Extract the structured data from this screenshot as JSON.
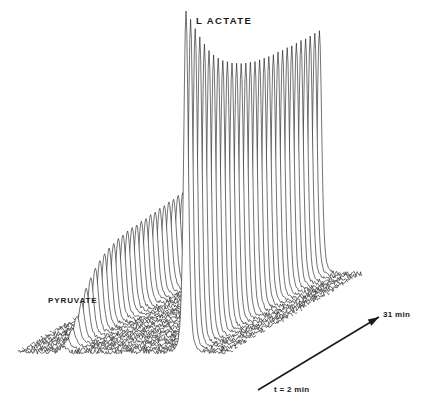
{
  "figure": {
    "type": "stacked-nmr-time-course",
    "background_color": "#ffffff",
    "trace_color": "#1a1a1a",
    "width": 425,
    "height": 408
  },
  "labels": {
    "lactate": "L ACTATE",
    "pyruvate": "PYRUVATE",
    "time_start": "t = 2 min",
    "time_end": "31 min"
  },
  "axis_arrow": {
    "name": "time-axis-arrow",
    "start_label": "t = 2 min",
    "end_label": "31 min",
    "x1": 258,
    "y1": 390,
    "x2": 379,
    "y2": 317
  },
  "chart_data": {
    "type": "line",
    "title": "",
    "subtitle": "",
    "xlabel": "",
    "ylabel": "",
    "grid": false,
    "legend_position": "none",
    "annotations": [
      {
        "text": "L ACTATE",
        "x": 196,
        "y": 15
      },
      {
        "text": "PYRUVATE",
        "x": 48,
        "y": 296
      },
      {
        "text": "t = 2 min",
        "x": 274,
        "y": 385
      },
      {
        "text": "31 min",
        "x": 383,
        "y": 310
      }
    ],
    "stack": {
      "n_traces": 30,
      "time_axis_label_start": "t = 2 min",
      "time_axis_label_end": "31 min",
      "time_start_min": 2,
      "time_end_min": 31,
      "time_step_min": 1,
      "offset_x_per_trace": 4.6,
      "offset_y_per_trace": -2.7,
      "origin_x": 18,
      "origin_y": 352,
      "baseline_span": 210
    },
    "peaks": [
      {
        "name": "pyruvate",
        "label": "PYRUVATE",
        "position_fraction": 0.215,
        "width": 4.2,
        "amplitudes": [
          6,
          10,
          18,
          28,
          39,
          50,
          58,
          65,
          70,
          74,
          77,
          79,
          81,
          82,
          83,
          84,
          84,
          85,
          85,
          86,
          86,
          87,
          87,
          88,
          88,
          89,
          89,
          90,
          90,
          91
        ]
      },
      {
        "name": "lactate",
        "label": "L ACTATE",
        "position_fraction": 0.8,
        "width": 3.2,
        "amplitudes": [
          341,
          330,
          318,
          307,
          297,
          288,
          281,
          275,
          270,
          266,
          262,
          259,
          256,
          254,
          252,
          250,
          249,
          248,
          247,
          246,
          246,
          245,
          245,
          244,
          244,
          244,
          243,
          243,
          243,
          243
        ]
      }
    ],
    "noise": {
      "amplitude": 2.2,
      "description": "baseline noise on every trace"
    }
  }
}
